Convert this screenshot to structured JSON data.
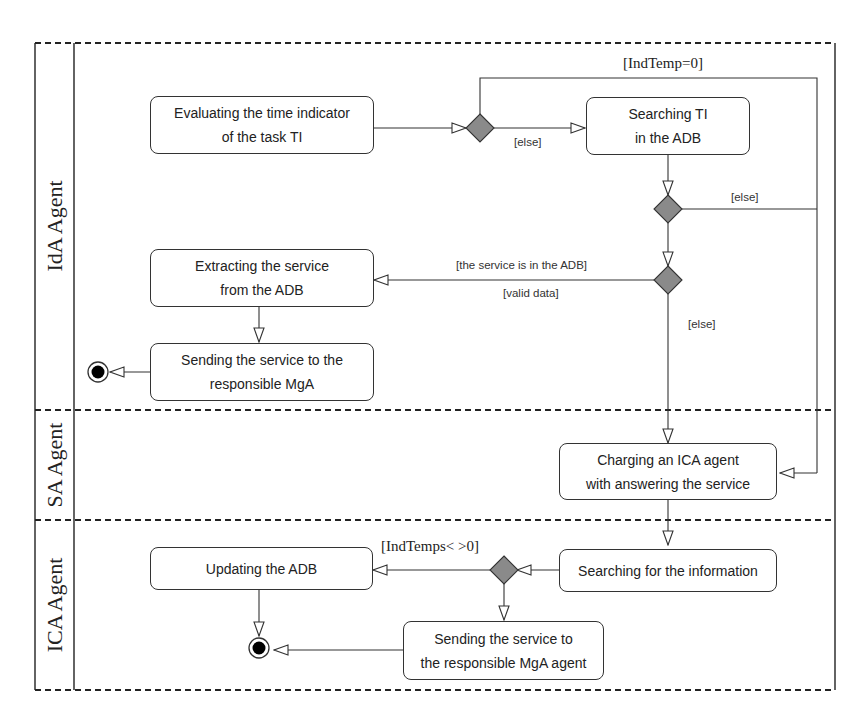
{
  "diagram": {
    "type": "UML activity diagram with swimlanes",
    "lanes": [
      {
        "label": "IdA Agent"
      },
      {
        "label": "SA Agent"
      },
      {
        "label": "ICA Agent"
      }
    ],
    "actions": {
      "evaluate": {
        "line1": "Evaluating the time indicator",
        "line2": "of the task TI"
      },
      "search_ti": {
        "line1": "Searching TI",
        "line2": "in the ADB"
      },
      "extract": {
        "line1": "Extracting the service",
        "line2": "from the ADB"
      },
      "send_mga": {
        "line1": "Sending the service to the",
        "line2": "responsible MgA"
      },
      "charge_ica": {
        "line1": "Charging an ICA agent",
        "line2": "with answering the service"
      },
      "search_info": {
        "line1": "Searching for the information"
      },
      "update_adb": {
        "line1": "Updating the ADB"
      },
      "send_mga_agent": {
        "line1": "Sending the service to",
        "line2": "the responsible MgA agent"
      }
    },
    "guards": {
      "indtemp_zero": "[IndTemp=0]",
      "else_1": "[else]",
      "else_2": "[else]",
      "service_in_adb": "[the service is in the ADB]",
      "valid_data": "[valid data]",
      "else_3": "[else]",
      "indtemps_nonzero": "[IndTemps< >0]"
    },
    "colors": {
      "line": "#333333",
      "decision_fill": "#8a8a8a",
      "final_fill": "#000000",
      "background": "#ffffff"
    }
  }
}
